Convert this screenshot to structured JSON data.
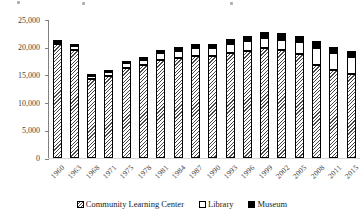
{
  "chart_data": {
    "type": "bar",
    "stacked": true,
    "title": "",
    "xlabel": "",
    "ylabel": "",
    "ylim": [
      0,
      25000
    ],
    "ytick_step": 5000,
    "ytick_labels": [
      "0",
      "5,000",
      "10,000",
      "15,000",
      "20,000",
      "25,000"
    ],
    "grid": false,
    "legend_position": "bottom",
    "categories": [
      "1960",
      "1963",
      "1968",
      "1971",
      "1975",
      "1978",
      "1981",
      "1984",
      "1987",
      "1990",
      "1993",
      "1996",
      "1999",
      "2002",
      "2005",
      "2008",
      "2011",
      "2015"
    ],
    "series": [
      {
        "name": "Community Learning Center",
        "style": "hatched",
        "values": [
          20650,
          19600,
          14300,
          14850,
          16250,
          16800,
          17800,
          18050,
          18450,
          18500,
          19100,
          19400,
          19950,
          19500,
          18900,
          16800,
          15900,
          15300
        ]
      },
      {
        "name": "Library",
        "style": "white",
        "values": [
          450,
          650,
          650,
          700,
          950,
          950,
          1150,
          1400,
          1450,
          1450,
          1550,
          1750,
          1850,
          1950,
          2100,
          3150,
          3050,
          2950
        ]
      },
      {
        "name": "Museum",
        "style": "black",
        "values": [
          350,
          350,
          350,
          350,
          400,
          500,
          600,
          650,
          750,
          800,
          850,
          900,
          1050,
          1150,
          1200,
          1300,
          1250,
          1250
        ]
      }
    ],
    "totals": [
      21450,
      20600,
      15300,
      15900,
      17600,
      18250,
      19550,
      20100,
      20650,
      20750,
      21500,
      22050,
      22850,
      22600,
      22200,
      21250,
      20200,
      19500
    ],
    "colors": {
      "hatch_foreground": "#4a4a4a",
      "library_fill": "#ffffff",
      "museum_fill": "#000000",
      "axis_line": "#808080",
      "tick_text": "#3f3f3f"
    }
  }
}
